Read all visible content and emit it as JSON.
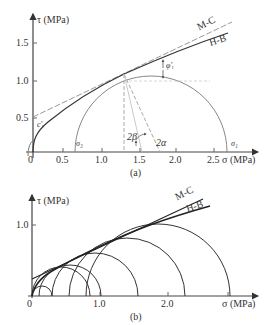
{
  "figure_a": {
    "caption": "(a)",
    "y_axis_label": "τ (MPa)",
    "x_axis_label": "σ (MPa)",
    "y_ticks": [
      "1.5",
      "1.0",
      "0.5"
    ],
    "x_ticks": [
      "0",
      "0.5",
      "1.0",
      "1.5",
      "2.0",
      "2.5"
    ],
    "curve_labels": {
      "mc": "M-C",
      "hb": "H-B"
    },
    "annotations": {
      "phi": "φ'ᵢ",
      "c": "c'ᵢ",
      "sigma3": "σ₃",
      "sigma1": "σ₁",
      "two_beta": "2β",
      "two_alpha": "2α"
    },
    "circle": {
      "sigma3": 0.6,
      "sigma1": 2.87
    }
  },
  "figure_b": {
    "caption": "(b)",
    "y_axis_label": "τ (MPa)",
    "x_axis_label": "σ (MPa)",
    "y_ticks": [
      "1.0"
    ],
    "x_ticks": [
      "0",
      "1.0",
      "2.0"
    ],
    "curve_labels": {
      "mc": "M-C",
      "hb": "H-B"
    },
    "circles": [
      {
        "sigma3": 0.0,
        "sigma1": 0.3
      },
      {
        "sigma3": 0.0,
        "sigma1": 0.85
      },
      {
        "sigma3": 0.1,
        "sigma1": 1.0
      },
      {
        "sigma3": 0.3,
        "sigma1": 1.55
      },
      {
        "sigma3": 0.55,
        "sigma1": 2.3
      },
      {
        "sigma3": 0.8,
        "sigma1": 2.95
      }
    ]
  }
}
